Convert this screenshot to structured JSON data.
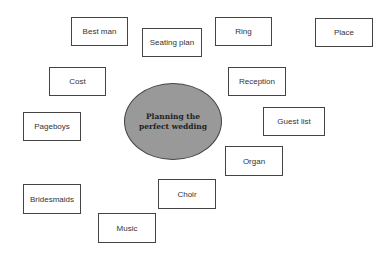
{
  "center": {
    "label": "Planning the\nperfect wedding",
    "fill": "#999999"
  },
  "nodes": [
    {
      "label": "Best man"
    },
    {
      "label": "Seating plan"
    },
    {
      "label": "Ring"
    },
    {
      "label": "Place"
    },
    {
      "label": "Cost"
    },
    {
      "label": "Reception"
    },
    {
      "label": "Pageboys"
    },
    {
      "label": "Guest list"
    },
    {
      "label": "Organ"
    },
    {
      "label": "Bridesmaids"
    },
    {
      "label": "Choir"
    },
    {
      "label": "Music"
    }
  ]
}
